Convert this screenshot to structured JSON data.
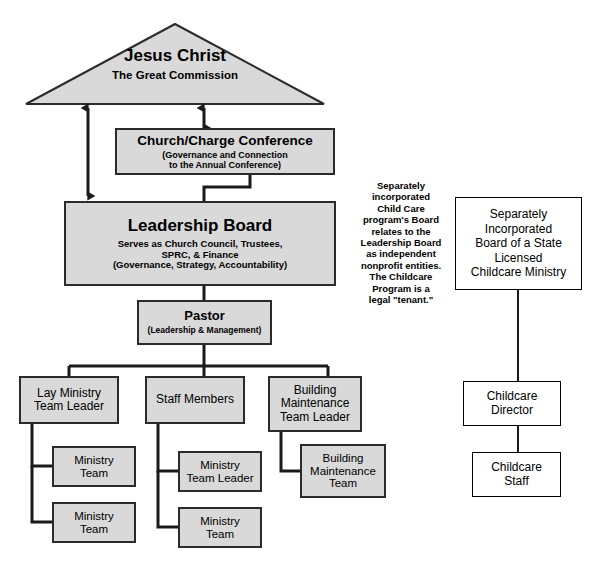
{
  "diagram": {
    "colors": {
      "box_fill": "#d9d9d9",
      "box_border": "#2b2b2b",
      "white_fill": "#ffffff",
      "white_border": "#000000",
      "line": "#1a1a1a",
      "background": "#ffffff"
    }
  },
  "triangle": {
    "line1": "Jesus Christ",
    "line2": "The Great Commission"
  },
  "nodes": {
    "church_charge_conference": {
      "title": "Church/Charge Conference",
      "sub1": "(Governance and Connection",
      "sub2": "to the Annual Conference)"
    },
    "leadership_board": {
      "title": "Leadership Board",
      "sub1": "Serves as Church Council, Trustees,",
      "sub2": "SPRC, & Finance",
      "sub3": "(Governance, Strategy, Accountability)"
    },
    "pastor": {
      "title": "Pastor",
      "sub1": "(Leadership & Management)"
    },
    "lay_ministry_team_leader": {
      "line1": "Lay Ministry",
      "line2": "Team Leader"
    },
    "staff_members": {
      "line1": "Staff Members"
    },
    "building_maintenance_team_leader": {
      "line1": "Building",
      "line2": "Maintenance",
      "line3": "Team Leader"
    },
    "ministry_team_1": {
      "line1": "Ministry",
      "line2": "Team"
    },
    "ministry_team_2": {
      "line1": "Ministry",
      "line2": "Team"
    },
    "ministry_team_leader": {
      "line1": "Ministry",
      "line2": "Team Leader"
    },
    "ministry_team_3": {
      "line1": "Ministry",
      "line2": "Team"
    },
    "building_maintenance_team": {
      "line1": "Building",
      "line2": "Maintenance",
      "line3": "Team"
    },
    "childcare_board": {
      "line1": "Separately",
      "line2": "Incorporated",
      "line3": "Board of a State",
      "line4": "Licensed",
      "line5": "Childcare Ministry"
    },
    "childcare_director": {
      "line1": "Childcare",
      "line2": "Director"
    },
    "childcare_staff": {
      "line1": "Childcare",
      "line2": "Staff"
    }
  },
  "annotation": {
    "childcare_note": "Separately\nincorporated\nChild Care\nprogram's Board\nrelates to the\nLeadership Board\nas independent\nnonprofit entities.\nThe Childcare\nProgram is a\nlegal \"tenant.\""
  }
}
